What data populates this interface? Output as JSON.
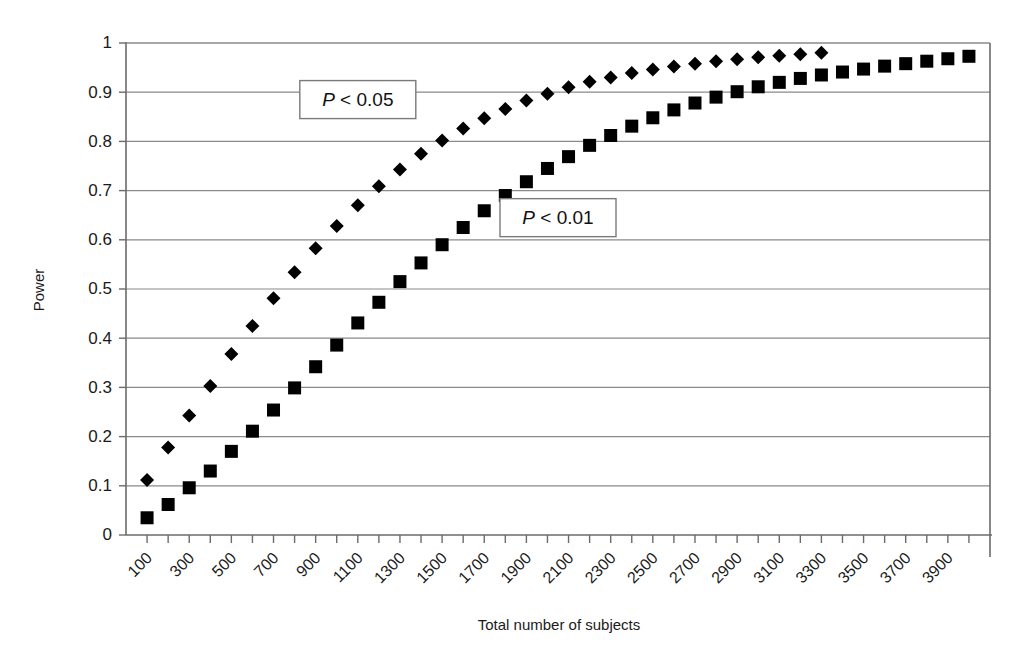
{
  "chart_data": {
    "type": "scatter",
    "title": "",
    "xlabel": "Total number of subjects",
    "ylabel": "Power",
    "xlim": [
      0,
      4100
    ],
    "ylim": [
      0,
      1
    ],
    "grid": true,
    "legend_position": "inline-annotations",
    "y_ticks": [
      "0",
      "0.1",
      "0.2",
      "0.3",
      "0.4",
      "0.5",
      "0.6",
      "0.7",
      "0.8",
      "0.9",
      "1"
    ],
    "y_tick_values": [
      0,
      0.1,
      0.2,
      0.3,
      0.4,
      0.5,
      0.6,
      0.7,
      0.8,
      0.9,
      1
    ],
    "x_ticks": [
      "100",
      "300",
      "500",
      "700",
      "900",
      "1100",
      "1300",
      "1500",
      "1700",
      "1900",
      "2100",
      "2300",
      "2500",
      "2700",
      "2900",
      "3100",
      "3300",
      "3500",
      "3700",
      "3900"
    ],
    "x_tick_values": [
      100,
      300,
      500,
      700,
      900,
      1100,
      1300,
      1500,
      1700,
      1900,
      2100,
      2300,
      2500,
      2700,
      2900,
      3100,
      3300,
      3500,
      3700,
      3900
    ],
    "annotations": [
      {
        "text": "P < 0.05",
        "italic_prefix": "P",
        "rest": " < 0.05",
        "x": 1100,
        "y": 0.885
      },
      {
        "text": "P < 0.01",
        "italic_prefix": "P",
        "rest": " < 0.01",
        "x": 2050,
        "y": 0.645
      }
    ],
    "series": [
      {
        "name": "P < 0.05",
        "marker": "diamond",
        "color": "#000000",
        "x": [
          100,
          200,
          300,
          400,
          500,
          600,
          700,
          800,
          900,
          1000,
          1100,
          1200,
          1300,
          1400,
          1500,
          1600,
          1700,
          1800,
          1900,
          2000,
          2100,
          2200,
          2300,
          2400,
          2500,
          2600,
          2700,
          2800,
          2900,
          3000,
          3100,
          3200,
          3300
        ],
        "values": [
          0.112,
          0.178,
          0.243,
          0.303,
          0.368,
          0.425,
          0.481,
          0.534,
          0.583,
          0.628,
          0.67,
          0.709,
          0.743,
          0.775,
          0.802,
          0.826,
          0.847,
          0.866,
          0.883,
          0.897,
          0.91,
          0.921,
          0.93,
          0.939,
          0.946,
          0.952,
          0.958,
          0.963,
          0.967,
          0.971,
          0.974,
          0.977,
          0.98
        ]
      },
      {
        "name": "P < 0.01",
        "marker": "square",
        "color": "#000000",
        "x": [
          100,
          200,
          300,
          400,
          500,
          600,
          700,
          800,
          900,
          1000,
          1100,
          1200,
          1300,
          1400,
          1500,
          1600,
          1700,
          1800,
          1900,
          2000,
          2100,
          2200,
          2300,
          2400,
          2500,
          2600,
          2700,
          2800,
          2900,
          3000,
          3100,
          3200,
          3300,
          3400,
          3500,
          3600,
          3700,
          3800,
          3900,
          4000
        ],
        "values": [
          0.035,
          0.062,
          0.096,
          0.13,
          0.17,
          0.211,
          0.254,
          0.299,
          0.342,
          0.386,
          0.431,
          0.473,
          0.515,
          0.553,
          0.59,
          0.625,
          0.659,
          0.69,
          0.718,
          0.745,
          0.769,
          0.792,
          0.812,
          0.831,
          0.848,
          0.864,
          0.878,
          0.89,
          0.901,
          0.911,
          0.92,
          0.928,
          0.935,
          0.941,
          0.947,
          0.953,
          0.958,
          0.963,
          0.968,
          0.973
        ]
      }
    ]
  },
  "axes": {
    "y_title": "Power",
    "x_title": "Total number of subjects"
  }
}
